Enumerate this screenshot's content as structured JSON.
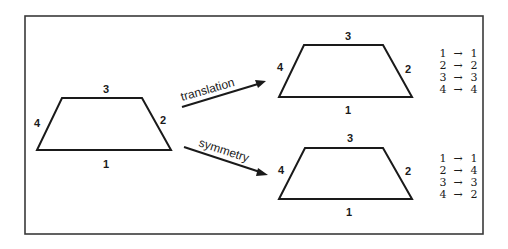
{
  "figure": {
    "colors": {
      "ink": "#1a1a1a",
      "frame": "#3a3a3a",
      "background": "#ffffff"
    },
    "source_shape": {
      "edges": {
        "bottom": "1",
        "right": "2",
        "top": "3",
        "left": "4"
      }
    },
    "transformations": [
      {
        "label": "translation",
        "result_shape": {
          "edges": {
            "bottom": "1",
            "right": "2",
            "top": "3",
            "left": "4"
          }
        },
        "mapping": [
          {
            "from": "1",
            "arrow": "→",
            "to": "1"
          },
          {
            "from": "2",
            "arrow": "→",
            "to": "2"
          },
          {
            "from": "3",
            "arrow": "→",
            "to": "3"
          },
          {
            "from": "4",
            "arrow": "→",
            "to": "4"
          }
        ]
      },
      {
        "label": "symmetry",
        "result_shape": {
          "edges": {
            "bottom": "1",
            "right": "2",
            "top": "3",
            "left": "4"
          }
        },
        "mapping": [
          {
            "from": "1",
            "arrow": "→",
            "to": "1"
          },
          {
            "from": "2",
            "arrow": "→",
            "to": "4"
          },
          {
            "from": "3",
            "arrow": "→",
            "to": "3"
          },
          {
            "from": "4",
            "arrow": "→",
            "to": "2"
          }
        ]
      }
    ]
  }
}
